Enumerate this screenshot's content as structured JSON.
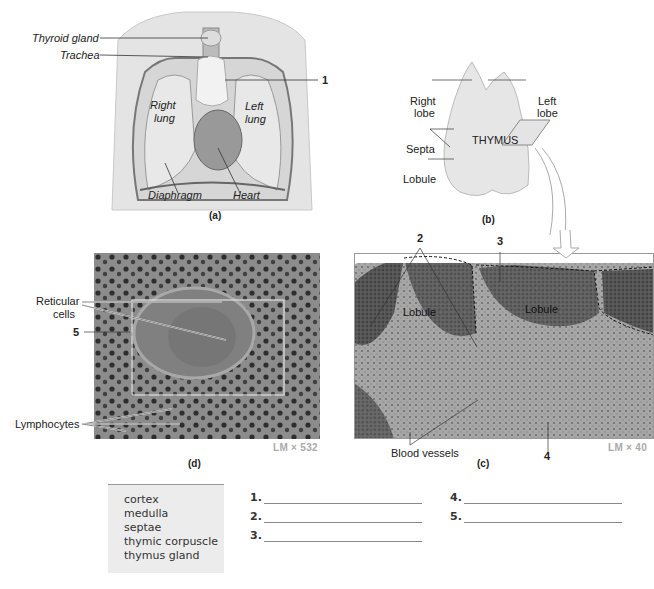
{
  "panel_a": {
    "labels": {
      "thyroid": "Thyroid gland",
      "trachea": "Trachea",
      "right_lung": [
        "Right",
        "lung"
      ],
      "left_lung": [
        "Left",
        "lung"
      ],
      "diaphragm": "Diaphragm",
      "heart": "Heart",
      "callout_1": "1"
    },
    "caption": "(a)"
  },
  "panel_b": {
    "labels": {
      "right_lobe": [
        "Right",
        "lobe"
      ],
      "left_lobe": [
        "Left",
        "lobe"
      ],
      "thymus": "THYMUS",
      "septa": "Septa",
      "lobule": "Lobule"
    },
    "caption": "(b)"
  },
  "panel_d": {
    "labels": {
      "reticular": [
        "Reticular",
        "cells"
      ],
      "callout_5": "5",
      "lymphocytes": "Lymphocytes"
    },
    "magnification": "LM × 532",
    "caption": "(d)"
  },
  "panel_c": {
    "labels": {
      "callout_2": "2",
      "callout_3": "3",
      "callout_4": "4",
      "lobule_left": "Lobule",
      "lobule_right": "Lobule",
      "blood_vessels": "Blood vessels"
    },
    "magnification": "LM × 40",
    "caption": "(c)"
  },
  "term_bank": [
    "cortex",
    "medulla",
    "septae",
    "thymic corpuscle",
    "thymus gland"
  ],
  "answers": [
    {
      "num": "1.",
      "value": ""
    },
    {
      "num": "2.",
      "value": ""
    },
    {
      "num": "3.",
      "value": ""
    },
    {
      "num": "4.",
      "value": ""
    },
    {
      "num": "5.",
      "value": ""
    }
  ]
}
